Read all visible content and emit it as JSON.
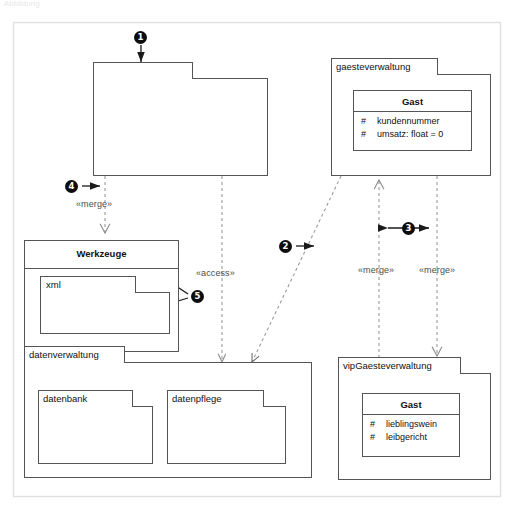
{
  "diagram": {
    "caption_faint": "Abbildung",
    "frame": {
      "border_color": "#e2e2e2",
      "background": "#ffffff"
    },
    "line_color": "#545454",
    "dash_color": "#9a9a9a",
    "bullet_color": "#0d0d0d"
  },
  "packages": [
    {
      "id": "unnamed-top",
      "name": "",
      "tab_label": ""
    },
    {
      "id": "gaesteverwaltung",
      "name": "gaesteverwaltung"
    },
    {
      "id": "werkzeuge",
      "name": "Werkzeuge"
    },
    {
      "id": "xml",
      "name": "xml"
    },
    {
      "id": "xml-second",
      "name": ""
    },
    {
      "id": "datenverwaltung",
      "name": "datenverwaltung"
    },
    {
      "id": "datenbank",
      "name": "datenbank"
    },
    {
      "id": "datenpflege",
      "name": "datenpflege"
    },
    {
      "id": "vipgaesteverwaltung",
      "name": "vipGaesteverwaltung"
    }
  ],
  "classes": [
    {
      "id": "gast-standard",
      "name": "Gast",
      "attributes": [
        {
          "visibility": "#",
          "text": "kundennummer"
        },
        {
          "visibility": "#",
          "text": "umsatz:  float = 0"
        }
      ]
    },
    {
      "id": "gast-vip",
      "name": "Gast",
      "attributes": [
        {
          "visibility": "#",
          "text": "lieblingswein"
        },
        {
          "visibility": "#",
          "text": "leibgericht"
        }
      ]
    }
  ],
  "relations": [
    {
      "id": "merge-top-werkzeuge",
      "stereotype": "«merge»",
      "from": "unnamed-top",
      "to": "werkzeuge"
    },
    {
      "id": "access-top-datenverwaltung",
      "stereotype": "«access»",
      "from": "unnamed-top",
      "to": "datenverwaltung"
    },
    {
      "id": "access-gaeste-datenverw",
      "stereotype": "",
      "from": "gaesteverwaltung",
      "to": "datenverwaltung"
    },
    {
      "id": "merge-vip-gaeste",
      "stereotype": "«merge»",
      "from": "vipgaesteverwaltung",
      "to": "gaesteverwaltung"
    },
    {
      "id": "merge-gaeste-vip",
      "stereotype": "«merge»",
      "from": "gaesteverwaltung",
      "to": "vipgaesteverwaltung"
    }
  ],
  "callouts": [
    {
      "id": "callout-1",
      "number": "1",
      "target": "unnamed-top-package-tab"
    },
    {
      "id": "callout-2",
      "number": "2",
      "target": "access-gaeste-datenverw"
    },
    {
      "id": "callout-3",
      "number": "3",
      "target": "merge-pair"
    },
    {
      "id": "callout-4",
      "number": "4",
      "target": "merge-top-werkzeuge"
    },
    {
      "id": "callout-5",
      "number": "5",
      "target": "nested-xml-packages"
    }
  ],
  "stereotype_labels": [
    {
      "id": "lbl-merge-left",
      "text": "«merge»"
    },
    {
      "id": "lbl-access",
      "text": "«access»"
    },
    {
      "id": "lbl-merge-midr",
      "text": "«merge»"
    },
    {
      "id": "lbl-merge-right",
      "text": "«merge»"
    }
  ]
}
